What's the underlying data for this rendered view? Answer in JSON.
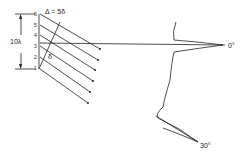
{
  "diagram": {
    "title_label": "Δ = 5δ",
    "aperture_label": "10λ",
    "delta_label": "δ",
    "element_numbers": [
      "1",
      "2",
      "3",
      "4",
      "5",
      "6"
    ],
    "beam_angles": [
      {
        "label": "0°"
      },
      {
        "label": "30°"
      }
    ],
    "stroke_color": "#222222",
    "background": "#ffffff"
  }
}
